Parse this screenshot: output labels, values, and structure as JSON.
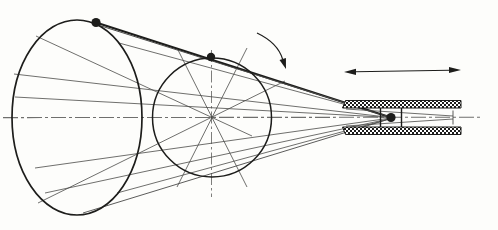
{
  "canvas": {
    "w": 498,
    "h": 230,
    "bg": "#fdfdfb"
  },
  "palette": {
    "ink": "#1d1d1b",
    "thin": "#4a4a48",
    "axis": "#6f6f6d",
    "axis_light": "#9a9a98",
    "paper": "#ffffff"
  },
  "diagram": {
    "axis": {
      "name": "cone-axis-centerline",
      "x1": 3,
      "y1": 117.6,
      "x2": 483,
      "y2": 117.2,
      "w": 1.1,
      "dash": "15 3 3 3"
    },
    "circle_axis": {
      "name": "section-vertical-centerline",
      "x1": 211.5,
      "y1": 50,
      "x2": 211.5,
      "y2": 197,
      "w": 0.9,
      "dash": "12 3 2.5 3"
    },
    "ellipse": {
      "name": "cone-base-ellipse",
      "cx": 77,
      "cy": 117.5,
      "rx": 65,
      "ry": 97.5,
      "w": 1.7
    },
    "circle": {
      "name": "cone-cross-section-circle",
      "cx": 212,
      "cy": 117.5,
      "r": 59.5,
      "w": 1.5
    },
    "generators": [
      {
        "name": "generator-top-silhouette-thick",
        "x1": 96,
        "y1": 22.5,
        "x2": 391,
        "y2": 117.5,
        "w": 2.3,
        "c": "ink"
      },
      {
        "name": "generator-top-companion",
        "x1": 98,
        "y1": 25,
        "x2": 347,
        "y2": 103.5,
        "w": 1.0,
        "c": "thin"
      },
      {
        "name": "generator-upper-1",
        "x1": 14,
        "y1": 74,
        "x2": 391,
        "y2": 117.5,
        "w": 0.8,
        "c": "thin"
      },
      {
        "name": "generator-upper-2",
        "x1": 15,
        "y1": 97,
        "x2": 391,
        "y2": 117.5,
        "w": 0.8,
        "c": "thin"
      },
      {
        "name": "generator-upper-3",
        "x1": 119,
        "y1": 43,
        "x2": 391,
        "y2": 117,
        "w": 0.8,
        "c": "thin"
      },
      {
        "name": "generator-lower-1",
        "x1": 35,
        "y1": 168,
        "x2": 391,
        "y2": 118,
        "w": 0.8,
        "c": "thin"
      },
      {
        "name": "generator-lower-2",
        "x1": 45,
        "y1": 193,
        "x2": 391,
        "y2": 118.5,
        "w": 0.8,
        "c": "thin"
      },
      {
        "name": "generator-bottom-silhouette",
        "x1": 83,
        "y1": 213,
        "x2": 391,
        "y2": 118.5,
        "w": 0.9,
        "c": "thin"
      },
      {
        "name": "generator-lower-3",
        "x1": 117,
        "y1": 193,
        "x2": 391,
        "y2": 118.5,
        "w": 0.8,
        "c": "thin"
      }
    ],
    "diameters": [
      {
        "name": "section-diameter-plus24",
        "x1": 38,
        "y1": 203,
        "x2": 285,
        "y2": 81,
        "w": 0.8,
        "c": "thin"
      },
      {
        "name": "section-diameter-minus24",
        "x1": 36,
        "y1": 36,
        "x2": 252,
        "y2": 136,
        "w": 0.8,
        "c": "thin"
      },
      {
        "name": "section-diameter-plus63",
        "x1": 177,
        "y1": 187,
        "x2": 247,
        "y2": 48,
        "w": 0.8,
        "c": "thin"
      },
      {
        "name": "section-diameter-minus63",
        "x1": 177,
        "y1": 48,
        "x2": 247,
        "y2": 187,
        "w": 0.8,
        "c": "thin"
      }
    ],
    "sleeve": {
      "pattern_cell": 4,
      "top_bar": {
        "name": "sleeve-top-wall-hatched",
        "d": "M345.5 100.5 H461 V108 H342.5 Z"
      },
      "bottom_bar": {
        "name": "sleeve-bottom-wall-hatched",
        "d": "M342.5 127 H461 V134.5 H345.5 Z"
      },
      "taper": [
        {
          "name": "socket-taper-upper",
          "x1": 346,
          "y1": 109,
          "x2": 453,
          "y2": 116,
          "w": 0.8,
          "c": "thin"
        },
        {
          "name": "socket-taper-lower",
          "x1": 346,
          "y1": 126,
          "x2": 453,
          "y2": 119,
          "w": 0.8,
          "c": "thin"
        }
      ],
      "socket_end": {
        "name": "socket-end-tick",
        "x1": 453,
        "y1": 110.5,
        "x2": 453,
        "y2": 124.5,
        "w": 0.9,
        "c": "thin"
      },
      "carriage": [
        {
          "name": "pivot-collar-left",
          "x1": 380.5,
          "y1": 108,
          "x2": 380.5,
          "y2": 127,
          "w": 1.4,
          "c": "ink"
        },
        {
          "name": "pivot-collar-right",
          "x1": 401.5,
          "y1": 108,
          "x2": 401.5,
          "y2": 127,
          "w": 1.4,
          "c": "ink"
        }
      ]
    },
    "dots": [
      {
        "name": "rim-point-base-dot",
        "cx": 96,
        "cy": 22.5,
        "r": 4.6
      },
      {
        "name": "rim-point-section-dot",
        "cx": 211,
        "cy": 57,
        "r": 4.2
      },
      {
        "name": "apex-pivot-dot",
        "cx": 391,
        "cy": 117.5,
        "r": 4.6
      }
    ],
    "rotation_arrow": {
      "name": "rotation-curved-arrow",
      "path": "M257 33 Q278 43 282.7 59.5",
      "w": 1.2,
      "head": "286,69 279.5,60.1 285.9,58"
    },
    "slide_arrow": {
      "name": "axial-slide-double-arrow",
      "shaft": {
        "x1": 355,
        "y1": 71.8,
        "x2": 450,
        "y2": 70.2,
        "w": 1.1
      },
      "heads": [
        "344,72 356,68.8 356,75",
        "461,70 449,66.9 449,73.1"
      ]
    }
  }
}
